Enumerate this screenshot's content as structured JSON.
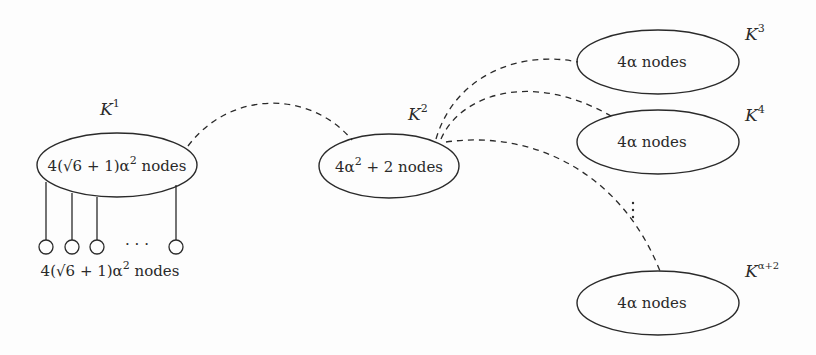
{
  "diagram": {
    "type": "graph-construction",
    "colors": {
      "stroke": "#2a2a2a",
      "background": "#fdfdfd"
    },
    "clusters": [
      {
        "id": "K1",
        "label_base": "K",
        "label_sup": "1",
        "text_pre": "4(",
        "sqrt": "√6",
        "text_mid": " + 1)α",
        "text_sup": "2",
        "text_post": " nodes"
      },
      {
        "id": "K2",
        "label_base": "K",
        "label_sup": "2",
        "text_pre": "4α",
        "text_sup": "2",
        "text_post": " + 2 nodes"
      },
      {
        "id": "K3",
        "label_base": "K",
        "label_sup": "3",
        "text": "4α nodes"
      },
      {
        "id": "K4",
        "label_base": "K",
        "label_sup": "4",
        "text": "4α nodes"
      },
      {
        "id": "Kalpha2",
        "label_base": "K",
        "label_sup": "α+2",
        "text": "4α nodes"
      }
    ],
    "leaves": {
      "count_visible": 4,
      "ellipsis": "· · ·",
      "label_pre": "4(",
      "label_sqrt": "√6",
      "label_mid": " + 1)α",
      "label_sup": "2",
      "label_post": " nodes"
    },
    "vertical_ellipsis": "⋮",
    "edges": [
      {
        "from": "K1",
        "to": "K2",
        "style": "dashed"
      },
      {
        "from": "K2",
        "to": "K3",
        "style": "dashed"
      },
      {
        "from": "K2",
        "to": "K4",
        "style": "dashed"
      },
      {
        "from": "K2",
        "to": "Kalpha2",
        "style": "dashed"
      }
    ]
  }
}
